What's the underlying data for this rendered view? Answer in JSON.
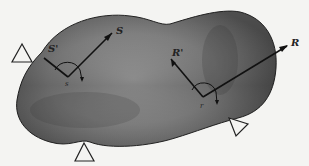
{
  "diagram": {
    "type": "rigid-body-with-supports",
    "points": [
      {
        "id": "s",
        "label": "s",
        "vectors": [
          {
            "label": "S'"
          },
          {
            "label": "S"
          }
        ]
      },
      {
        "id": "r",
        "label": "r",
        "vectors": [
          {
            "label": "R'"
          },
          {
            "label": "R"
          }
        ]
      }
    ],
    "labels": {
      "S_prime": "S'",
      "S": "S",
      "s": "s",
      "R_prime": "R'",
      "R": "R",
      "r": "r"
    },
    "supports_count": 3,
    "colors": {
      "body_dark": "#4a4a4a",
      "body_light": "#b8b8b8",
      "line": "#111111",
      "background": "#f4f4f2"
    }
  }
}
